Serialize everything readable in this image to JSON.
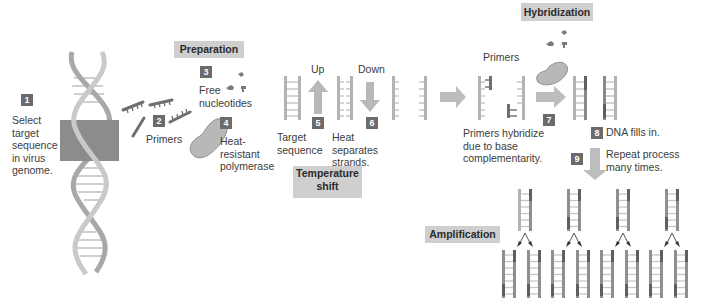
{
  "colors": {
    "badge": "#6b6b6b",
    "section_bg": "#cfcfcf",
    "strand_light": "#b9b9b9",
    "strand_mid": "#9a9a9a",
    "primer_dark": "#6e6e6e",
    "arrow": "#bdbdbd",
    "target_box": "#8a8a8a",
    "polymerase": "#b5b5b5"
  },
  "sections": {
    "preparation": "Preparation",
    "temperature_shift": "Temperature\nshift",
    "hybridization": "Hybridization",
    "amplification": "Amplification"
  },
  "steps": [
    {
      "num": "1",
      "text": "Select\ntarget\nsequence\nin virus\ngenome."
    },
    {
      "num": "2",
      "text": "Primers"
    },
    {
      "num": "3",
      "text": "Free\nnucleotides"
    },
    {
      "num": "4",
      "text": "Heat-\nresistant\npolymerase"
    },
    {
      "num": "5",
      "text": "Target\nsequence"
    },
    {
      "num": "6",
      "text": "Heat\nseparates\nstrands."
    },
    {
      "num": "7",
      "text": "Primers hybridize\ndue to base\ncomplementarity."
    },
    {
      "num": "8",
      "text": "DNA fills in."
    },
    {
      "num": "9",
      "text": "Repeat process\nmany times."
    }
  ],
  "labels": {
    "up": "Up",
    "down": "Down",
    "primers_top": "Primers"
  },
  "icons": {
    "dna_helix": "double-helix",
    "target_box": "highlight-rectangle",
    "primer": "comb-strand",
    "nucleotide": "small-blob",
    "polymerase": "bean-shape",
    "arrow_up": "thick-arrow-up",
    "arrow_down": "thick-arrow-down",
    "arrow_right": "thick-arrow-right",
    "split_arrow": "fork-arrow"
  }
}
